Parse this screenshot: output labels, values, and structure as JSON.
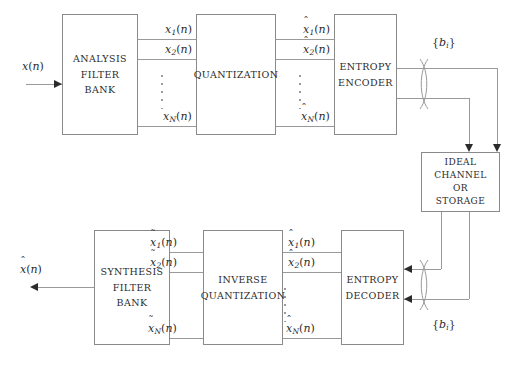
{
  "diagram": {
    "line_color": "#9a9a9a",
    "text_color": "#2b2b2b",
    "background": "#ffffff"
  },
  "blocks": {
    "analysis": {
      "line1": "ANALYSIS",
      "line2": "FILTER",
      "line3": "BANK"
    },
    "quantization": {
      "line1": "QUANTIZATION"
    },
    "entropy_encoder": {
      "line1": "ENTROPY",
      "line2": "ENCODER"
    },
    "channel": {
      "line1": "IDEAL",
      "line2": "CHANNEL",
      "line3": "OR",
      "line4": "STORAGE"
    },
    "entropy_decoder": {
      "line1": "ENTROPY",
      "line2": "DECODER"
    },
    "inverse_quantization": {
      "line1": "INVERSE",
      "line2": "QUANTIZATION"
    },
    "synthesis": {
      "line1": "SYNTHESIS",
      "line2": "FILTER",
      "line3": "BANK"
    }
  },
  "signals": {
    "input": {
      "base": "x",
      "accent": "",
      "sub": "",
      "args": "(n)"
    },
    "output": {
      "base": "x",
      "accent": "ˆ",
      "sub": "",
      "args": "(n)"
    },
    "subband": {
      "s1": {
        "base": "x",
        "sub": "1",
        "args": "(n)"
      },
      "s2": {
        "base": "x",
        "sub": "2",
        "args": "(n)"
      },
      "sN": {
        "base": "x",
        "sub": "N",
        "args": "(n)"
      }
    },
    "quantized": {
      "accent": "ˆ",
      "s1": {
        "base": "x",
        "sub": "1",
        "args": "(n)"
      },
      "s2": {
        "base": "x",
        "sub": "2",
        "args": "(n)"
      },
      "sN": {
        "base": "x",
        "sub": "N",
        "args": "(n)"
      }
    },
    "dequantized": {
      "accent": "ˆ",
      "s1": {
        "base": "x",
        "sub": "1",
        "args": "(n)"
      },
      "s2": {
        "base": "x",
        "sub": "2",
        "args": "(n)"
      },
      "sN": {
        "base": "x",
        "sub": "N",
        "args": "(n)"
      }
    },
    "reconstructed": {
      "accent": "˜",
      "s1": {
        "base": "x",
        "sub": "1",
        "args": "(n)"
      },
      "s2": {
        "base": "x",
        "sub": "2",
        "args": "(n)"
      },
      "sN": {
        "base": "x",
        "sub": "N",
        "args": "(n)"
      }
    },
    "bitstream_top": {
      "open": "{",
      "base": "b",
      "sub": "i",
      "close": "}"
    },
    "bitstream_bottom": {
      "open": "{",
      "base": "b",
      "sub": "i",
      "close": "}"
    }
  }
}
